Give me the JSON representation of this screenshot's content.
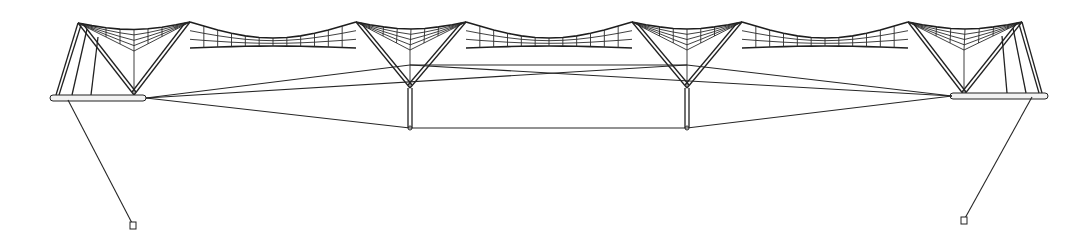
{
  "figure": {
    "title": "",
    "width": 1091,
    "height": 242,
    "colors": {
      "line": "#222222",
      "background": "#ffffff"
    }
  },
  "masts": [
    {
      "id": "mast-1",
      "left_peak": [
        78,
        23
      ],
      "right_peak": [
        190,
        22
      ],
      "vertex": [
        134,
        95
      ],
      "post_bottom": null
    },
    {
      "id": "mast-2",
      "left_peak": [
        356,
        22
      ],
      "right_peak": [
        466,
        22
      ],
      "vertex": [
        410,
        88
      ],
      "post_bottom": [
        410,
        128
      ]
    },
    {
      "id": "mast-3",
      "left_peak": [
        632,
        22
      ],
      "right_peak": [
        742,
        22
      ],
      "vertex": [
        687,
        88
      ],
      "post_bottom": [
        687,
        128
      ]
    },
    {
      "id": "mast-4",
      "left_peak": [
        908,
        22
      ],
      "right_peak": [
        1022,
        22
      ],
      "vertex": [
        964,
        95
      ],
      "post_bottom": null
    }
  ],
  "booms": [
    {
      "id": "left-boom",
      "x1": 50,
      "x2": 146,
      "y": 98
    },
    {
      "id": "right-boom",
      "x1": 950,
      "x2": 1048,
      "y": 96
    }
  ],
  "cables": {
    "upper": [
      [
        [
          146,
          98
        ],
        [
          410,
          65
        ]
      ],
      [
        [
          410,
          65
        ],
        [
          687,
          65
        ]
      ],
      [
        [
          687,
          65
        ],
        [
          952,
          96
        ]
      ],
      [
        [
          146,
          98
        ],
        [
          687,
          65
        ]
      ],
      [
        [
          410,
          65
        ],
        [
          952,
          96
        ]
      ]
    ],
    "lower": [
      [
        146,
        98
      ],
      [
        410,
        128
      ],
      [
        687,
        128
      ],
      [
        952,
        96
      ]
    ]
  },
  "anchors": [
    {
      "id": "left-anchor",
      "from": [
        68,
        100
      ],
      "to": [
        133,
        225
      ]
    },
    {
      "id": "right-anchor",
      "from": [
        1032,
        97
      ],
      "to": [
        964,
        220
      ]
    }
  ]
}
